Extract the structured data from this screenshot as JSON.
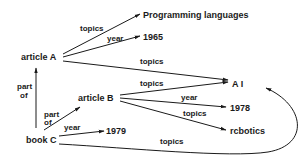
{
  "nodes": {
    "article_a": "article A",
    "article_b": "article B",
    "book_c": "book C",
    "programming_languages": "Programming languages",
    "year_1965": "1965",
    "ai": "A I",
    "year_1978": "1978",
    "robotics": "rcbotics",
    "year_1979": "1979"
  },
  "edges": {
    "a_topics_pl": "topics",
    "a_year_1965": "year",
    "a_topics_ai": "topics",
    "b_topics_ai": "topics",
    "b_year_1978": "year",
    "b_topics_robotics": "topics",
    "c_partof_a_line1": "part",
    "c_partof_a_line2": "of",
    "c_partof_b_line1": "part",
    "c_partof_b_line2": "of",
    "c_year_1979": "year",
    "c_topics_ai": "topics"
  },
  "colors": {
    "ink": "#1a1a1a",
    "background": "#ffffff"
  }
}
